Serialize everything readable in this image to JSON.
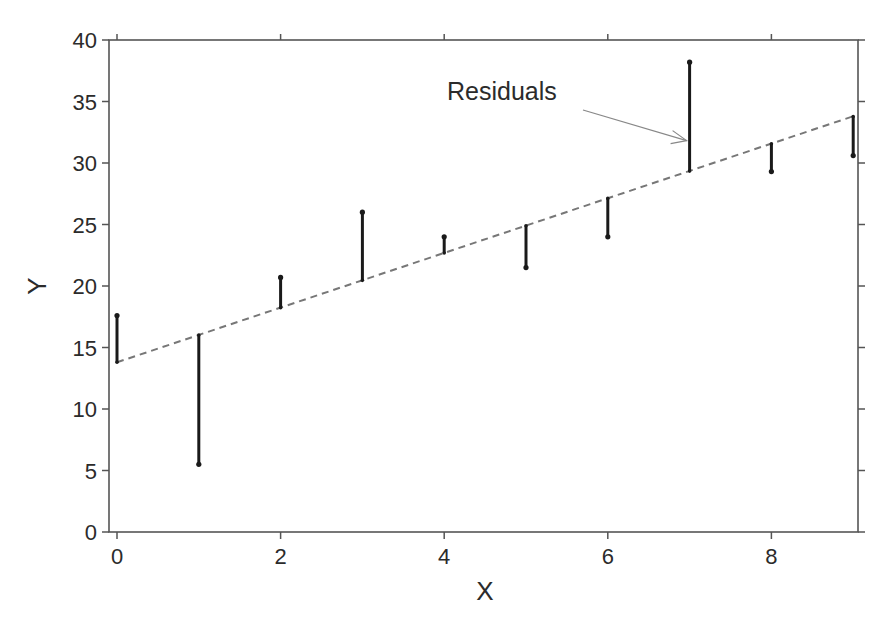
{
  "chart_data": {
    "type": "scatter",
    "title": "",
    "xlabel": "X",
    "ylabel": "Y",
    "xlim": [
      -0.1,
      9.1
    ],
    "ylim": [
      0,
      40
    ],
    "xticks": [
      0,
      2,
      4,
      6,
      8
    ],
    "yticks": [
      0,
      5,
      10,
      15,
      20,
      25,
      30,
      35,
      40
    ],
    "grid": false,
    "legend": null,
    "series": [
      {
        "name": "Observed",
        "x": [
          0,
          1,
          2,
          3,
          4,
          5,
          6,
          7,
          8,
          9
        ],
        "y": [
          17.6,
          5.5,
          20.7,
          26.0,
          24.0,
          21.5,
          24.0,
          38.2,
          29.3,
          30.6
        ]
      },
      {
        "name": "Fitted line",
        "style": "dashed",
        "intercept": 13.8,
        "slope": 2.22,
        "x": [
          0,
          9
        ],
        "y": [
          13.8,
          33.8
        ]
      }
    ],
    "annotations": [
      {
        "text": "Residuals",
        "x": 4.0,
        "y": 35.0,
        "arrow_to": [
          7,
          31.9
        ]
      }
    ],
    "residuals_shown_as": "vertical segments from each point to fitted line"
  },
  "colors": {
    "axis": "#555555",
    "residual": "#1a1a1a",
    "fit_line": "#777777",
    "arrow": "#888888",
    "text": "#2b2b2b"
  }
}
